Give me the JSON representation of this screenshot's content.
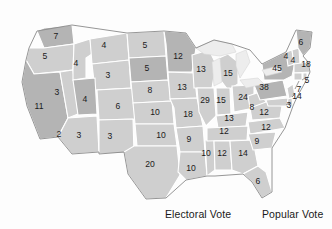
{
  "map": {
    "title": "United States Electoral Vote Map",
    "colors": {
      "state_fill_light": "#cfcfcf",
      "state_fill_dark": "#b4b4b4",
      "state_border": "#ffffff",
      "map_outline": "#8a8a8a",
      "lake_fill": "#ededed",
      "label_text": "#1b1b1b",
      "background": "#fdfdfd"
    },
    "states": [
      {
        "code": "WA",
        "name": "Washington",
        "votes": "7",
        "shade": "dark",
        "x": 56,
        "y": 37
      },
      {
        "code": "OR",
        "name": "Oregon",
        "votes": "5",
        "shade": "light",
        "x": 45,
        "y": 57
      },
      {
        "code": "CA",
        "name": "California",
        "votes": "11",
        "shade": "dark",
        "x": 39,
        "y": 107
      },
      {
        "code": "NV",
        "name": "Nevada",
        "votes": "3",
        "shade": "light",
        "x": 57,
        "y": 93
      },
      {
        "code": "ID",
        "name": "Idaho",
        "votes": "4",
        "shade": "light",
        "x": 76,
        "y": 64
      },
      {
        "code": "MT",
        "name": "Montana",
        "votes": "4",
        "shade": "light",
        "x": 104,
        "y": 46
      },
      {
        "code": "WY",
        "name": "Wyoming",
        "votes": "3",
        "shade": "light",
        "x": 108,
        "y": 76
      },
      {
        "code": "UT",
        "name": "Utah",
        "votes": "4",
        "shade": "dark",
        "x": 85,
        "y": 100
      },
      {
        "code": "AZ",
        "name": "Arizona",
        "votes": "3",
        "shade": "light",
        "x": 79,
        "y": 136
      },
      {
        "code": "CAs",
        "name": "California South",
        "votes": "2",
        "shade": "light",
        "x": 59,
        "y": 135
      },
      {
        "code": "CO",
        "name": "Colorado",
        "votes": "6",
        "shade": "light",
        "x": 118,
        "y": 107
      },
      {
        "code": "NM",
        "name": "New Mexico",
        "votes": "3",
        "shade": "light",
        "x": 110,
        "y": 137
      },
      {
        "code": "ND",
        "name": "North Dakota",
        "votes": "5",
        "shade": "light",
        "x": 145,
        "y": 46
      },
      {
        "code": "SD",
        "name": "South Dakota",
        "votes": "5",
        "shade": "dark",
        "x": 147,
        "y": 69
      },
      {
        "code": "NE",
        "name": "Nebraska",
        "votes": "8",
        "shade": "light",
        "x": 150,
        "y": 91
      },
      {
        "code": "KS",
        "name": "Kansas",
        "votes": "10",
        "shade": "light",
        "x": 155,
        "y": 113
      },
      {
        "code": "OK",
        "name": "Oklahoma",
        "votes": "10",
        "shade": "light",
        "x": 161,
        "y": 136
      },
      {
        "code": "TX",
        "name": "Texas",
        "votes": "20",
        "shade": "light",
        "x": 150,
        "y": 165
      },
      {
        "code": "MN",
        "name": "Minnesota",
        "votes": "12",
        "shade": "dark",
        "x": 178,
        "y": 57
      },
      {
        "code": "IA",
        "name": "Iowa",
        "votes": "13",
        "shade": "light",
        "x": 182,
        "y": 88
      },
      {
        "code": "MO",
        "name": "Missouri",
        "votes": "18",
        "shade": "light",
        "x": 188,
        "y": 115
      },
      {
        "code": "AR",
        "name": "Arkansas",
        "votes": "9",
        "shade": "light",
        "x": 189,
        "y": 140
      },
      {
        "code": "LA",
        "name": "Louisiana",
        "votes": "10",
        "shade": "light",
        "x": 191,
        "y": 169
      },
      {
        "code": "WI",
        "name": "Wisconsin",
        "votes": "13",
        "shade": "light",
        "x": 201,
        "y": 70
      },
      {
        "code": "IL",
        "name": "Illinois",
        "votes": "29",
        "shade": "light",
        "x": 205,
        "y": 101
      },
      {
        "code": "MS",
        "name": "Mississippi",
        "votes": "10",
        "shade": "light",
        "x": 206,
        "y": 154
      },
      {
        "code": "MI",
        "name": "Michigan",
        "votes": "15",
        "shade": "light",
        "x": 228,
        "y": 74
      },
      {
        "code": "IN",
        "name": "Indiana",
        "votes": "15",
        "shade": "light",
        "x": 221,
        "y": 101
      },
      {
        "code": "KY",
        "name": "Kentucky",
        "votes": "13",
        "shade": "light",
        "x": 229,
        "y": 119
      },
      {
        "code": "TN",
        "name": "Tennessee",
        "votes": "12",
        "shade": "light",
        "x": 224,
        "y": 132
      },
      {
        "code": "AL",
        "name": "Alabama",
        "votes": "12",
        "shade": "light",
        "x": 222,
        "y": 154
      },
      {
        "code": "OH",
        "name": "Ohio",
        "votes": "24",
        "shade": "light",
        "x": 243,
        "y": 98
      },
      {
        "code": "GA",
        "name": "Georgia",
        "votes": "14",
        "shade": "light",
        "x": 243,
        "y": 154
      },
      {
        "code": "WV",
        "name": "West Virginia",
        "votes": "8",
        "shade": "light",
        "x": 252,
        "y": 108
      },
      {
        "code": "SC",
        "name": "South Carolina",
        "votes": "9",
        "shade": "light",
        "x": 257,
        "y": 142
      },
      {
        "code": "FL",
        "name": "Florida",
        "votes": "6",
        "shade": "light",
        "x": 258,
        "y": 182
      },
      {
        "code": "PA",
        "name": "Pennsylvania",
        "votes": "38",
        "shade": "dark",
        "x": 264,
        "y": 88
      },
      {
        "code": "VA",
        "name": "Virginia",
        "votes": "12",
        "shade": "light",
        "x": 264,
        "y": 113
      },
      {
        "code": "NC",
        "name": "North Carolina",
        "votes": "12",
        "shade": "light",
        "x": 266,
        "y": 128
      },
      {
        "code": "NY",
        "name": "New York",
        "votes": "45",
        "shade": "dark",
        "x": 277,
        "y": 69
      },
      {
        "code": "VT",
        "name": "Vermont",
        "votes": "4",
        "shade": "light",
        "x": 286,
        "y": 57
      },
      {
        "code": "NH",
        "name": "New Hampshire",
        "votes": "4",
        "shade": "light",
        "x": 293,
        "y": 61
      },
      {
        "code": "ME",
        "name": "Maine",
        "votes": "6",
        "shade": "dark",
        "x": 301,
        "y": 43
      },
      {
        "code": "MA",
        "name": "Massachusetts",
        "votes": "18",
        "shade": "light",
        "x": 306,
        "y": 65
      },
      {
        "code": "RI",
        "name": "Rhode Island",
        "votes": "5",
        "shade": "light",
        "x": 307,
        "y": 81
      },
      {
        "code": "CT",
        "name": "Connecticut",
        "votes": "7",
        "shade": "light",
        "x": 299,
        "y": 90
      },
      {
        "code": "NJ",
        "name": "New Jersey",
        "votes": "14",
        "shade": "light",
        "x": 297,
        "y": 97
      },
      {
        "code": "DE",
        "name": "Delaware",
        "votes": "3",
        "shade": "light",
        "x": 289,
        "y": 106
      }
    ],
    "lakes": [
      "Lake Superior",
      "Lake Michigan",
      "Lake Huron",
      "Lake Erie",
      "Lake Ontario"
    ]
  },
  "footer": {
    "electoral_vote_label": "Electoral Vote",
    "popular_vote_label": "Popular Vote"
  }
}
